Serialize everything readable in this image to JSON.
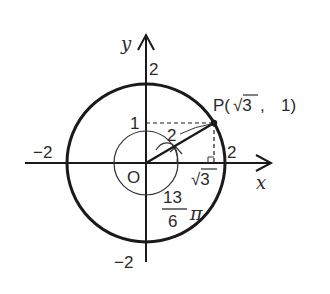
{
  "diagram": {
    "type": "unit-circle-angle",
    "axes": {
      "x_label": "x",
      "y_label": "y",
      "origin_label": "O"
    },
    "ticks": {
      "x_pos": "2",
      "x_neg": "−2",
      "y_pos": "2",
      "y_neg": "−2",
      "y_one": "1"
    },
    "circle": {
      "radius_value": 2
    },
    "point": {
      "label": "P",
      "coord_open": "P(",
      "coord_x": "√3",
      "coord_sep": ",",
      "coord_y": "1)"
    },
    "segment_labels": {
      "radius": "2",
      "horizontal": "√3"
    },
    "angle": {
      "numerator": "13",
      "denominator": "6",
      "pi": "π",
      "value": "13/6 π"
    },
    "colors": {
      "ink": "#1a1a1a",
      "text": "#2a2a2a",
      "background": "#ffffff"
    }
  }
}
